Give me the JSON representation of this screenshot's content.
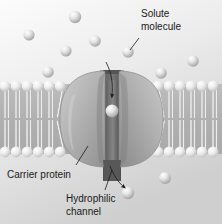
{
  "figure": {
    "width": 222,
    "height": 224
  },
  "labels": {
    "solute": {
      "line1": "Solute",
      "line2": "molecule"
    },
    "carrier": {
      "line1": "Carrier protein"
    },
    "channel": {
      "line1": "Hydrophilic",
      "line2": "channel"
    }
  },
  "colors": {
    "background_top": "#fbfbfb",
    "background_bottom": "#d6d6d6",
    "membrane_core": "#b4b4b4",
    "lipid_head_light": "#fafafa",
    "lipid_head_shade": "#c2c2c2",
    "lipid_tail": "#e8e8e8",
    "protein_light": "#bdbdbd",
    "protein_mid": "#a6a6a6",
    "protein_dark": "#8d8d8d",
    "channel_dark": "#5a5a5a",
    "solute_light": "#f0f0f0",
    "solute_shade": "#9a9a9a",
    "text": "#1a1a1a",
    "arrow": "#1a1a1a"
  },
  "solutes": {
    "extracellular": [
      {
        "id": "s1",
        "cx": 75,
        "cy": 17,
        "r": 6.2
      },
      {
        "id": "s2",
        "cx": 29,
        "cy": 35,
        "r": 5.6
      },
      {
        "id": "s3",
        "cx": 95,
        "cy": 41,
        "r": 5.8
      },
      {
        "id": "s4",
        "cx": 66,
        "cy": 51,
        "r": 5.6
      },
      {
        "id": "s5",
        "cx": 128,
        "cy": 52,
        "r": 5.8
      },
      {
        "id": "s6",
        "cx": 193,
        "cy": 61,
        "r": 5.8
      },
      {
        "id": "s7",
        "cx": 48,
        "cy": 72,
        "r": 5.8
      },
      {
        "id": "s8",
        "cx": 161,
        "cy": 73,
        "r": 5.8
      }
    ],
    "in_channel": [
      {
        "id": "sc1",
        "cx": 112,
        "cy": 111,
        "r": 6.4
      }
    ],
    "intracellular": [
      {
        "id": "si1",
        "cx": 128,
        "cy": 193,
        "r": 6.2
      },
      {
        "id": "si2",
        "cx": 165,
        "cy": 178,
        "r": 6.0
      }
    ]
  },
  "membrane": {
    "top_head_y": 85,
    "bottom_head_y": 152,
    "head_radius": 5.4,
    "left_lipid_x": [
      6,
      17,
      28,
      39,
      50,
      61
    ],
    "right_lipid_x": [
      156,
      167,
      178,
      189,
      200,
      211
    ],
    "leaflets": 2
  },
  "carrier_protein": {
    "left_lobe": {
      "cx": 81,
      "cy": 118,
      "rx": 28,
      "ry": 45
    },
    "right_lobe": {
      "cx": 143,
      "cy": 118,
      "rx": 26,
      "ry": 45
    },
    "channel": {
      "x": 104,
      "y": 70,
      "width": 16,
      "height": 110
    }
  },
  "arrows": {
    "influx": {
      "label": "solute entering channel",
      "direction": "down"
    },
    "efflux": {
      "label": "solute exiting channel",
      "direction": "down-right"
    }
  }
}
